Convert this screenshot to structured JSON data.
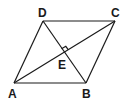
{
  "diagram": {
    "type": "rhombus-with-diagonals",
    "vertices": {
      "A": {
        "label": "A",
        "x": 14,
        "y": 83
      },
      "B": {
        "label": "B",
        "x": 86,
        "y": 83
      },
      "C": {
        "label": "C",
        "x": 115,
        "y": 21
      },
      "D": {
        "label": "D",
        "x": 43,
        "y": 21
      }
    },
    "intersection": {
      "label": "E",
      "x": 64,
      "y": 52
    },
    "annotations": [
      "right-angle marker at E between diagonals AC and BD"
    ],
    "colors": {
      "stroke": "#1a1a1a",
      "background": "#ffffff"
    }
  }
}
